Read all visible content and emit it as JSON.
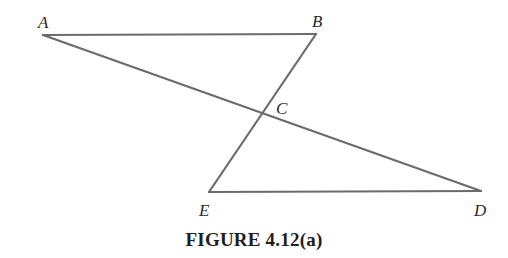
{
  "figure": {
    "caption": "FIGURE 4.12(a)",
    "line_color": "#6b6b6b",
    "line_width": 2.2,
    "points": {
      "A": {
        "label": "A",
        "x": 43,
        "y": 35,
        "lx": 38,
        "ly": 28
      },
      "B": {
        "label": "B",
        "x": 316,
        "y": 34,
        "lx": 312,
        "ly": 27
      },
      "C": {
        "label": "C",
        "x": 261,
        "y": 114,
        "lx": 276,
        "ly": 114
      },
      "D": {
        "label": "D",
        "x": 481,
        "y": 191,
        "lx": 474,
        "ly": 216
      },
      "E": {
        "label": "E",
        "x": 209,
        "y": 192,
        "lx": 199,
        "ly": 216
      }
    },
    "segments": [
      {
        "name": "segment-AB",
        "from": "A",
        "to": "B"
      },
      {
        "name": "segment-AD",
        "from": "A",
        "to": "D"
      },
      {
        "name": "segment-BE",
        "from": "B",
        "to": "E"
      },
      {
        "name": "segment-ED",
        "from": "E",
        "to": "D"
      }
    ]
  }
}
